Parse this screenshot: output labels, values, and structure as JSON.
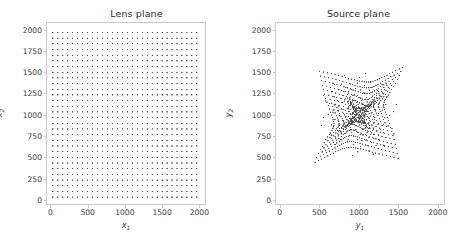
{
  "figure": {
    "width": 458,
    "height": 238,
    "background": "#ffffff",
    "dot_color": "#4d4d4d",
    "frame_color": "#c8c8c8",
    "text_color": "#3a3a3a"
  },
  "panels": [
    {
      "id": "lens",
      "title": "Lens plane",
      "xlabel": "x",
      "xlabel_sub": "1",
      "ylabel": "x",
      "ylabel_sub": "2",
      "xticks": [
        0,
        500,
        1000,
        1500,
        2000
      ],
      "yticks": [
        0,
        250,
        500,
        750,
        1000,
        1250,
        1500,
        1750,
        2000
      ],
      "xticklabels": [
        "0",
        "500",
        "1000",
        "1500",
        "2000"
      ],
      "yticklabels": [
        "0",
        "250",
        "500",
        "750",
        "1000",
        "1250",
        "1500",
        "1750",
        "2000"
      ],
      "xlim": [
        -60,
        2090
      ],
      "ylim": [
        -60,
        2090
      ],
      "plot_rect": {
        "x": 46,
        "y": 22,
        "w": 160,
        "h": 183
      },
      "marker": {
        "size": 1.15,
        "shape": "square"
      },
      "render": "grid"
    },
    {
      "id": "source",
      "title": "Source plane",
      "xlabel": "y",
      "xlabel_sub": "1",
      "ylabel": "y",
      "ylabel_sub": "2",
      "xticks": [
        0,
        500,
        1000,
        1500,
        2000
      ],
      "yticks": [
        0,
        250,
        500,
        750,
        1000,
        1250,
        1500,
        1750,
        2000
      ],
      "xticklabels": [
        "0",
        "500",
        "1000",
        "1500",
        "2000"
      ],
      "yticklabels": [
        "0",
        "250",
        "500",
        "750",
        "1000",
        "1250",
        "1500",
        "1750",
        "2000"
      ],
      "xlim": [
        -60,
        2090
      ],
      "ylim": [
        -60,
        2090
      ],
      "plot_rect": {
        "x": 275,
        "y": 22,
        "w": 170,
        "h": 183
      },
      "marker": {
        "size": 1.15,
        "shape": "square"
      },
      "render": "lensed"
    }
  ],
  "chart_data": {
    "type": "scatter",
    "grid": {
      "n_x": 30,
      "n_y": 30,
      "x_min": 33,
      "x_max": 1967,
      "y_min": 33,
      "y_max": 1967,
      "spacing": 66.7
    },
    "lens_model": {
      "name": "softened-isothermal-ellipsoid deflection",
      "center": [
        1000,
        1000
      ],
      "einstein_radius": 620,
      "core_radius": 26,
      "ellipticity": 0.22,
      "position_angle_deg": 28,
      "external_shear": 0.045,
      "shear_angle_deg": -18
    },
    "lens_plane": {
      "xlabel": "x_1",
      "ylabel": "x_2",
      "xlim": [
        -60,
        2090
      ],
      "ylim": [
        -60,
        2090
      ],
      "xticks": [
        0,
        500,
        1000,
        1500,
        2000
      ],
      "yticks": [
        0,
        250,
        500,
        750,
        1000,
        1250,
        1500,
        1750,
        2000
      ],
      "grid": false,
      "n_points": 900
    },
    "source_plane": {
      "xlabel": "y_1",
      "ylabel": "y_2",
      "xlim": [
        -60,
        2090
      ],
      "ylim": [
        -60,
        2090
      ],
      "xticks": [
        0,
        500,
        1000,
        1500,
        2000
      ],
      "yticks": [
        0,
        250,
        500,
        750,
        1000,
        1250,
        1500,
        1750,
        2000
      ],
      "grid": false,
      "n_points": 900,
      "extent_observed": {
        "x_min": 160,
        "x_max": 1880,
        "y_min": 175,
        "y_max": 1865
      },
      "caustic_center": [
        950,
        1010
      ]
    },
    "legend": null,
    "series": [
      {
        "name": "lens plane grid points",
        "marker": "square",
        "color": "#4d4d4d",
        "size": 1.15
      },
      {
        "name": "source plane mapped points",
        "marker": "square",
        "color": "#4d4d4d",
        "size": 1.15
      }
    ]
  }
}
